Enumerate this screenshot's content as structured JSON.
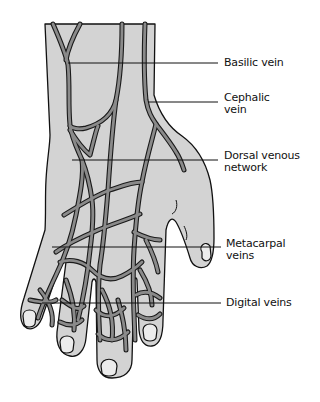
{
  "diagram": {
    "colors": {
      "skin": "#d3d3d3",
      "vein": "#8a8a8a",
      "outline": "#111111",
      "background": "#ffffff"
    },
    "labels": [
      {
        "id": "basilic",
        "text_lines": [
          "Basilic vein"
        ],
        "x": 222,
        "y": 58
      },
      {
        "id": "cephalic",
        "text_lines": [
          "Cephalic",
          "vein"
        ],
        "x": 222,
        "y": 92
      },
      {
        "id": "dorsal",
        "text_lines": [
          "Dorsal venous",
          "network"
        ],
        "x": 222,
        "y": 150
      },
      {
        "id": "metacarpal",
        "text_lines": [
          "Metacarpal",
          "veins"
        ],
        "x": 225,
        "y": 237
      },
      {
        "id": "digital",
        "text_lines": [
          "Digital veins"
        ],
        "x": 225,
        "y": 295
      }
    ]
  }
}
